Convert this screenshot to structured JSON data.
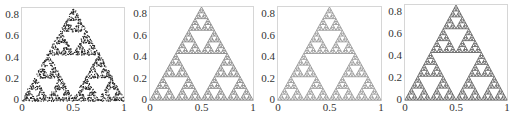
{
  "chart_data": [
    {
      "type": "scatter",
      "title": "",
      "description": "Sierpinski triangle approximation (random/chaos-game points, sparse, dark)",
      "xlabel": "",
      "ylabel": "",
      "xlim": [
        0,
        1
      ],
      "ylim": [
        0,
        0.866
      ],
      "xticks": [
        "0",
        "0.5",
        "1"
      ],
      "yticks": [
        "0",
        "0.2",
        "0.4",
        "0.6",
        "0.8"
      ],
      "vertices": [
        [
          0,
          0
        ],
        [
          1,
          0
        ],
        [
          0.5,
          0.866
        ]
      ],
      "depth": 5,
      "color": "#222222",
      "style": "noisy",
      "grid": false
    },
    {
      "type": "scatter",
      "title": "",
      "description": "Sierpinski triangle (clean, medium gray)",
      "xlabel": "",
      "ylabel": "",
      "xlim": [
        0,
        1
      ],
      "ylim": [
        0,
        0.866
      ],
      "xticks": [
        "0",
        "0.5",
        "1"
      ],
      "yticks": [
        "0",
        "0.2",
        "0.4",
        "0.6",
        "0.8"
      ],
      "vertices": [
        [
          0,
          0
        ],
        [
          1,
          0
        ],
        [
          0.5,
          0.866
        ]
      ],
      "depth": 5,
      "color": "#8a8a8a",
      "style": "solid",
      "grid": false
    },
    {
      "type": "scatter",
      "title": "",
      "description": "Sierpinski triangle (clean, light gray)",
      "xlabel": "",
      "ylabel": "",
      "xlim": [
        0,
        1
      ],
      "ylim": [
        0,
        0.866
      ],
      "xticks": [
        "0",
        "0.5",
        "1"
      ],
      "yticks": [
        "0",
        "0.2",
        "0.4",
        "0.6",
        "0.8"
      ],
      "vertices": [
        [
          0,
          0
        ],
        [
          1,
          0
        ],
        [
          0.5,
          0.866
        ]
      ],
      "depth": 5,
      "color": "#9a9a9a",
      "style": "solid",
      "grid": false
    },
    {
      "type": "scatter",
      "title": "",
      "description": "Sierpinski triangle (clean, dark gray)",
      "xlabel": "",
      "ylabel": "",
      "xlim": [
        0,
        1
      ],
      "ylim": [
        0,
        0.866
      ],
      "xticks": [
        "0",
        "0.5",
        "1"
      ],
      "yticks": [
        "0",
        "0.2",
        "0.4",
        "0.6",
        "0.8"
      ],
      "vertices": [
        [
          0,
          0
        ],
        [
          1,
          0
        ],
        [
          0.5,
          0.866
        ]
      ],
      "depth": 5,
      "color": "#666666",
      "style": "solid",
      "grid": false
    }
  ],
  "layout": {
    "panels": [
      {
        "box_left": 21,
        "box_top": 7,
        "box_width": 104,
        "box_height": 94
      },
      {
        "box_left": 149,
        "box_top": 6,
        "box_width": 105,
        "box_height": 95
      },
      {
        "box_left": 277,
        "box_top": 6,
        "box_width": 105,
        "box_height": 95
      },
      {
        "box_left": 404,
        "box_top": 4,
        "box_width": 104,
        "box_height": 97
      }
    ]
  }
}
